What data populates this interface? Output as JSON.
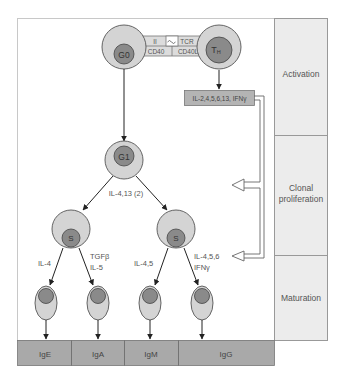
{
  "colors": {
    "background": "#ffffff",
    "frame_border": "#c8c8c8",
    "cell_outer": "#d4d4d4",
    "cell_nucleus": "#8a8a8a",
    "cell_stroke": "#555555",
    "stage_panel": "#ececec",
    "stage_border": "#999999",
    "ig_bar": "#a9a9a9",
    "cytokine_box": "#b4b4b4",
    "arrow": "#222222",
    "text": "#555555"
  },
  "cells": {
    "g0": {
      "label": "G0"
    },
    "th": {
      "label": "TH",
      "label_main": "T",
      "label_sub": "H"
    },
    "g1": {
      "label": "G1"
    },
    "s_left": {
      "label": "S"
    },
    "s_right": {
      "label": "S"
    }
  },
  "interaction": {
    "top_left": "II",
    "top_right": "TCR",
    "bottom_left": "CD40",
    "bottom_right": "CD40L"
  },
  "cytokine_box": {
    "label": "IL-2,4,5,6,13, IFNγ"
  },
  "arrow_labels": {
    "g1_split": "IL-4,13 (2)",
    "to_ige": "IL-4",
    "to_iga_line1": "TGFβ",
    "to_iga_line2": "IL-5",
    "to_igm": "IL-4,5",
    "to_igg_line1": "IL-4,5,6",
    "to_igg_line2": "IFNγ"
  },
  "stages": [
    {
      "label": "Activation"
    },
    {
      "label_line1": "Clonal",
      "label_line2": "proliferation"
    },
    {
      "label": "Maturation"
    }
  ],
  "immunoglobulins": [
    {
      "label": "IgE"
    },
    {
      "label": "IgA"
    },
    {
      "label": "IgM"
    },
    {
      "label": "IgG"
    }
  ]
}
